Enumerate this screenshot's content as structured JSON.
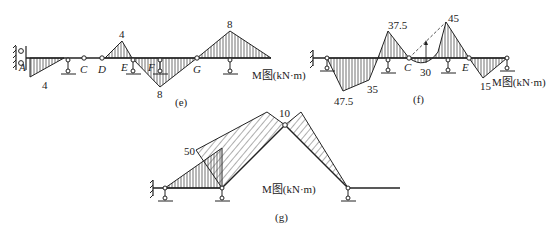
{
  "panels": {
    "e": {
      "caption": "(e)",
      "title": "M图(kN·m)",
      "points": [
        "A",
        "C",
        "D",
        "E",
        "F",
        "G"
      ],
      "values": {
        "A_end": "4",
        "DE_peak": "4",
        "EG_peak": "8",
        "G_right_peak": "8"
      }
    },
    "f": {
      "caption": "(f)",
      "title": "M图(kN·m)",
      "points": [
        "C",
        "E"
      ],
      "values": {
        "v1": "47.5",
        "v2": "35",
        "v3": "37.5",
        "v4": "30",
        "v5": "45",
        "v6": "15"
      }
    },
    "g": {
      "caption": "(g)",
      "title": "M图(kN·m)",
      "values": {
        "v1": "50",
        "v2": "10"
      }
    }
  },
  "colors": {
    "line": "#222222",
    "hatch": "#333333",
    "bg": "#ffffff"
  }
}
